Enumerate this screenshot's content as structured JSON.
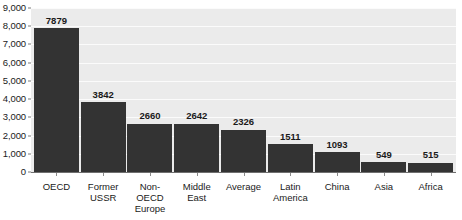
{
  "chart_data": {
    "type": "bar",
    "title": "",
    "subtitle": "",
    "xlabel": "",
    "ylabel": "",
    "ylim": [
      0,
      9000
    ],
    "grid": true,
    "legend": false,
    "legend_position": "none",
    "bar_color": "#333333",
    "plot_background": "#ebebeb",
    "gridline_color": "#fbfbfb",
    "page_background": "#ffffff",
    "y_ticks": [
      {
        "value": 9000,
        "label": "9,000"
      },
      {
        "value": 8000,
        "label": "8,000"
      },
      {
        "value": 7000,
        "label": "7,000"
      },
      {
        "value": 6000,
        "label": "6,000"
      },
      {
        "value": 5000,
        "label": "5,000"
      },
      {
        "value": 4000,
        "label": "4,000"
      },
      {
        "value": 3000,
        "label": "3,000"
      },
      {
        "value": 2000,
        "label": "2,000"
      },
      {
        "value": 1000,
        "label": "1,000"
      },
      {
        "value": 0,
        "label": "0"
      }
    ],
    "categories": [
      "OECD",
      "Former USSR",
      "Non-OECD Europe",
      "Middle East",
      "Average",
      "Latin America",
      "China",
      "Asia",
      "Africa"
    ],
    "category_labels": [
      "OECD",
      "Former\nUSSR",
      "Non-OECD\nEurope",
      "Middle East",
      "Average",
      "Latin\nAmerica",
      "China",
      "Asia",
      "Africa"
    ],
    "values": [
      7879,
      3842,
      2660,
      2642,
      2326,
      1511,
      1093,
      549,
      515
    ],
    "value_labels": [
      "7879",
      "3842",
      "2660",
      "2642",
      "2326",
      "1511",
      "1093",
      "549",
      "515"
    ]
  }
}
